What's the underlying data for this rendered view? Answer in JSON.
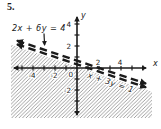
{
  "problem_number": "5.",
  "colors": {
    "ink": "#1b1b1b",
    "hatch": "#8f8f8f",
    "background": "#ffffff"
  },
  "chart_data": {
    "type": "line",
    "xlabel": "x",
    "ylabel": "y",
    "origin_label": "0",
    "xlim": [
      -6,
      6.8
    ],
    "ylim": [
      -4.5,
      4.9
    ],
    "tick_step": 1,
    "grid": false,
    "legend": "none",
    "x_tick_labels": [
      {
        "value": -4,
        "text": "-4",
        "side": "below"
      },
      {
        "value": -2,
        "text": "-2",
        "side": "below"
      },
      {
        "value": 2,
        "text": "2",
        "side": "above"
      },
      {
        "value": 4,
        "text": "4",
        "side": "above"
      }
    ],
    "y_tick_labels": [
      {
        "value": 4,
        "text": "4"
      },
      {
        "value": 2,
        "text": "2"
      },
      {
        "value": -2,
        "text": "-2"
      }
    ],
    "series": [
      {
        "name": "2x + 6y = 4",
        "slope": -0.33333,
        "y_intercept": 0.66667,
        "x_intercept": 2,
        "line_style": "dashed",
        "arrows": "both-ends"
      },
      {
        "name": "x + 3y = 1",
        "slope": -0.33333,
        "y_intercept": 0.33333,
        "x_intercept": 1,
        "line_style": "dashed",
        "arrows": "both-ends"
      }
    ],
    "annotations": [
      {
        "text": "2x + 6y = 4",
        "target": "upper-line",
        "placement": "top-left horizontal, arrow pointing down to line"
      },
      {
        "text": "x + 3y = 1",
        "target": "lower-line",
        "placement": "rotated along lower line, below it"
      }
    ],
    "shaded_region": {
      "description": "region below the line x + 3y = 1",
      "style": "diagonal-hatching",
      "boundary": "dashed (excluded)"
    }
  }
}
